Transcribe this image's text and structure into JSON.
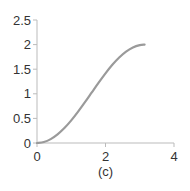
{
  "chart_data": {
    "type": "line",
    "title": "",
    "caption": "(c)",
    "xlabel": "",
    "ylabel": "",
    "xlim": [
      0,
      4
    ],
    "ylim": [
      0,
      2.5
    ],
    "xticks": [
      0,
      2,
      4
    ],
    "xtick_labels": [
      "0",
      "2",
      "4"
    ],
    "yticks": [
      0,
      0.5,
      1,
      1.5,
      2,
      2.5
    ],
    "ytick_labels": [
      "0",
      "0.5",
      "1",
      "1.5",
      "2",
      "2.5"
    ],
    "grid": false,
    "legend": null,
    "series": [
      {
        "name": "y = 1 - cos(x)",
        "color": "#9a9a9a",
        "x": [
          0,
          0.2,
          0.4,
          0.6,
          0.8,
          1.0,
          1.2,
          1.4,
          1.6,
          1.8,
          2.0,
          2.2,
          2.4,
          2.6,
          2.8,
          3.0,
          3.1416
        ],
        "y": [
          0,
          0.02,
          0.079,
          0.175,
          0.303,
          0.46,
          0.638,
          0.83,
          1.029,
          1.227,
          1.416,
          1.589,
          1.737,
          1.857,
          1.942,
          1.99,
          2.0
        ]
      }
    ],
    "axis_color": "#bbbbbb"
  }
}
